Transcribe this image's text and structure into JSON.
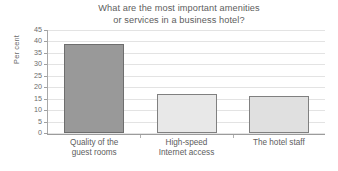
{
  "chart_data": {
    "type": "bar",
    "title": "What are the most important amenities\nor services in a business hotel?",
    "title_line1": "What are the most important amenities",
    "title_line2": "or services in a business hotel?",
    "xlabel": "",
    "ylabel": "Per cent",
    "ylim": [
      0,
      45
    ],
    "ytick_step": 5,
    "yticks": [
      "45",
      "40",
      "35",
      "30",
      "25",
      "20",
      "15",
      "10",
      "5",
      "0"
    ],
    "ytick_values": [
      45,
      40,
      35,
      30,
      25,
      20,
      15,
      10,
      5,
      0
    ],
    "grid": true,
    "legend": "none",
    "categories": [
      "Quality of the\nguest rooms",
      "High-speed\nInternet access",
      "The hotel staff"
    ],
    "category_lines": [
      [
        "Quality of the",
        "guest rooms"
      ],
      [
        "High-speed",
        "Internet access"
      ],
      [
        "The hotel staff"
      ]
    ],
    "values": [
      39,
      17,
      16
    ],
    "bar_colors": [
      "#999999",
      "#e8e8e8",
      "#e0e0e0"
    ],
    "bar_border_colors": [
      "#6e6e6e",
      "#808080",
      "#808080"
    ]
  },
  "colors": {
    "background": "#ffffff",
    "text": "#5d5d5d",
    "tick_text": "#6b6b6b",
    "gridline": "#e3e3e3",
    "axis": "#9c9c9c"
  }
}
